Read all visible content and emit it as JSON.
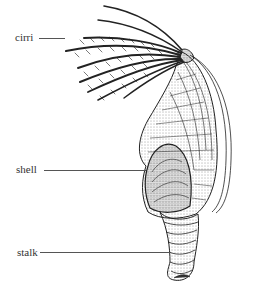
{
  "diagram": {
    "labels": [
      {
        "id": "cirri",
        "text": "cirri"
      },
      {
        "id": "shell",
        "text": "shell"
      },
      {
        "id": "stalk",
        "text": "stalk"
      }
    ]
  },
  "colors": {
    "background": "#ffffff",
    "ink": "#222222",
    "label_text": "#333333",
    "leader_line": "#555555"
  }
}
